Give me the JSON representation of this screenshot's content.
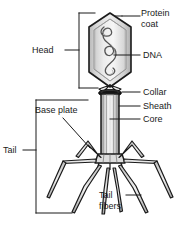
{
  "figure": {
    "type": "labeled-biological-diagram",
    "background_color": "#ffffff",
    "line_color": "#1a1a1a",
    "fill_light": "#e8e8e8",
    "fill_mid": "#c8c8c8",
    "fill_dark": "#9a9a9a",
    "collar_color": "#141414"
  },
  "labels": {
    "protein_coat_line1": "Protein",
    "protein_coat_line2": "coat",
    "dna": "DNA",
    "head": "Head",
    "collar": "Collar",
    "sheath": "Sheath",
    "core": "Core",
    "base_plate": "Base plate",
    "tail": "Tail",
    "tail_fibers_line1": "Tail",
    "tail_fibers_line2": "fibers"
  },
  "parts": [
    {
      "name": "protein-coat",
      "label": "Protein coat",
      "region": "head-outer-shell"
    },
    {
      "name": "dna",
      "label": "DNA",
      "region": "head-interior-strand"
    },
    {
      "name": "head",
      "label": "Head",
      "region": "hexagonal-capsid"
    },
    {
      "name": "collar",
      "label": "Collar",
      "region": "ring-below-head"
    },
    {
      "name": "sheath",
      "label": "Sheath",
      "region": "tail-outer-tube"
    },
    {
      "name": "core",
      "label": "Core",
      "region": "tail-inner-tube"
    },
    {
      "name": "base-plate",
      "label": "Base plate",
      "region": "tail-bottom-plate"
    },
    {
      "name": "tail",
      "label": "Tail",
      "region": "whole-tail-assembly"
    },
    {
      "name": "tail-fibers",
      "label": "Tail fibers",
      "region": "six-legs"
    }
  ]
}
